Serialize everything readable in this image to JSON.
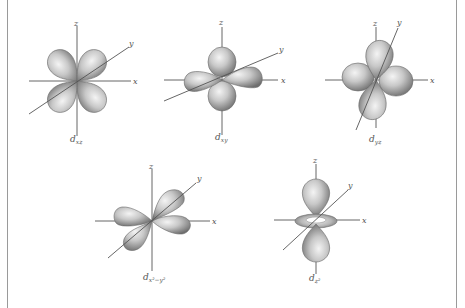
{
  "figure": {
    "axis_labels": {
      "x": "x",
      "y": "y",
      "z": "z"
    },
    "orbitals": [
      {
        "id": "dxz",
        "label_main": "d",
        "label_sub": "xz",
        "center": [
          77,
          81
        ]
      },
      {
        "id": "dxy",
        "label_main": "d",
        "label_sub": "xy",
        "center": [
          222,
          80
        ]
      },
      {
        "id": "dyz",
        "label_main": "d",
        "label_sub": "yz",
        "center": [
          376,
          80
        ]
      },
      {
        "id": "dx2y2",
        "label_main": "d",
        "label_sub": "x²−y²",
        "center": [
          152,
          221
        ]
      },
      {
        "id": "dz2",
        "label_main": "d",
        "label_sub": "z²",
        "center": [
          316,
          220
        ]
      }
    ],
    "colors": {
      "background": "#ffffff",
      "border": "#9a9a9a",
      "axis": "#555555",
      "lobe_light": "#f2f2f2",
      "lobe_dark": "#6e6e6e"
    }
  }
}
